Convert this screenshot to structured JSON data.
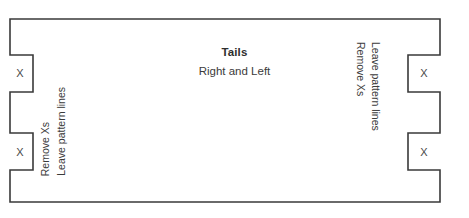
{
  "diagram": {
    "kind": "dovetail-tails-board-layout",
    "stroke_color": "#3a3a3a",
    "fill_color": "#ffffff",
    "background_color": "#ffffff",
    "center": {
      "title": "Tails",
      "subtitle": "Right and Left"
    },
    "left_side": {
      "label_line_1": "Remove Xs",
      "label_line_2": "Leave pattern lines",
      "notches": [
        {
          "mark": "X"
        },
        {
          "mark": "X"
        }
      ]
    },
    "right_side": {
      "label_line_1": "Remove Xs",
      "label_line_2": "Leave pattern lines",
      "notches": [
        {
          "mark": "X"
        },
        {
          "mark": "X"
        }
      ]
    }
  }
}
